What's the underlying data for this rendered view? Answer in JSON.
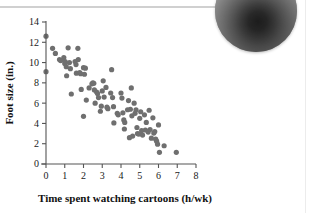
{
  "page": {
    "background_color": "#ffffff",
    "rule_color": "#d0d0d0"
  },
  "figure": {
    "photo": {
      "name": "swirl-photo",
      "shape": "circle",
      "description": "grayscale circular photo of a spiral/rope texture, cropped at page top-right"
    }
  },
  "chart_data": {
    "type": "scatter",
    "title": "",
    "xlabel": "Time spent watching cartoons (h/wk)",
    "ylabel": "Foot size (in.)",
    "xlim": [
      0,
      8
    ],
    "ylim": [
      0,
      14
    ],
    "xticks": [
      0,
      1,
      2,
      3,
      4,
      5,
      6,
      7,
      8
    ],
    "yticks": [
      0,
      2,
      4,
      6,
      8,
      10,
      12,
      14
    ],
    "xticklabels": [
      "0",
      "1",
      "2",
      "3",
      "4",
      "5",
      "6",
      "7",
      "8"
    ],
    "yticklabels": [
      "0",
      "2",
      "4",
      "6",
      "8",
      "10",
      "12",
      "14"
    ],
    "grid": false,
    "legend": null,
    "marker_color": "#6f6f6f",
    "marker_size": 2.6,
    "relationship": "negative linear association",
    "points": [
      [
        0.0,
        12.6
      ],
      [
        0.0,
        9.1
      ],
      [
        0.35,
        11.4
      ],
      [
        0.5,
        10.9
      ],
      [
        0.72,
        10.3
      ],
      [
        0.78,
        10.2
      ],
      [
        0.95,
        10.5
      ],
      [
        1.0,
        9.9
      ],
      [
        1.02,
        10.1
      ],
      [
        1.08,
        9.6
      ],
      [
        1.1,
        8.7
      ],
      [
        1.18,
        11.45
      ],
      [
        1.25,
        10.0
      ],
      [
        1.3,
        9.4
      ],
      [
        1.35,
        6.9
      ],
      [
        1.55,
        10.1
      ],
      [
        1.6,
        9.8
      ],
      [
        1.62,
        8.95
      ],
      [
        1.7,
        11.4
      ],
      [
        1.72,
        10.3
      ],
      [
        1.8,
        9.0
      ],
      [
        1.85,
        8.9
      ],
      [
        1.88,
        7.35
      ],
      [
        2.0,
        9.5
      ],
      [
        2.05,
        8.85
      ],
      [
        2.1,
        9.45
      ],
      [
        2.15,
        6.3
      ],
      [
        2.0,
        4.7
      ],
      [
        2.3,
        7.5
      ],
      [
        2.45,
        7.9
      ],
      [
        2.5,
        8.0
      ],
      [
        2.55,
        7.95
      ],
      [
        2.58,
        7.3
      ],
      [
        2.62,
        6.0
      ],
      [
        2.7,
        7.1
      ],
      [
        2.75,
        6.95
      ],
      [
        2.8,
        6.55
      ],
      [
        2.9,
        5.2
      ],
      [
        2.95,
        5.7
      ],
      [
        3.0,
        7.2
      ],
      [
        3.05,
        8.2
      ],
      [
        3.1,
        6.6
      ],
      [
        3.2,
        7.55
      ],
      [
        3.25,
        5.6
      ],
      [
        3.3,
        5.45
      ],
      [
        3.45,
        7.0
      ],
      [
        3.5,
        9.3
      ],
      [
        3.55,
        6.55
      ],
      [
        3.6,
        5.65
      ],
      [
        3.62,
        4.05
      ],
      [
        3.8,
        5.0
      ],
      [
        3.85,
        4.85
      ],
      [
        4.0,
        7.0
      ],
      [
        4.05,
        6.5
      ],
      [
        4.1,
        5.05
      ],
      [
        4.15,
        4.35
      ],
      [
        4.18,
        3.45
      ],
      [
        4.2,
        4.1
      ],
      [
        4.35,
        5.35
      ],
      [
        4.4,
        6.25
      ],
      [
        4.45,
        2.6
      ],
      [
        4.5,
        5.4
      ],
      [
        4.55,
        7.5
      ],
      [
        4.58,
        4.75
      ],
      [
        4.62,
        2.75
      ],
      [
        4.7,
        6.0
      ],
      [
        4.75,
        5.0
      ],
      [
        4.8,
        5.35
      ],
      [
        4.85,
        3.6
      ],
      [
        4.88,
        3.0
      ],
      [
        4.95,
        2.95
      ],
      [
        5.0,
        4.5
      ],
      [
        5.05,
        5.15
      ],
      [
        5.1,
        3.3
      ],
      [
        5.15,
        2.85
      ],
      [
        5.25,
        4.85
      ],
      [
        5.3,
        3.35
      ],
      [
        5.35,
        4.1
      ],
      [
        5.45,
        3.15
      ],
      [
        5.5,
        5.3
      ],
      [
        5.55,
        3.4
      ],
      [
        5.62,
        2.55
      ],
      [
        5.7,
        4.55
      ],
      [
        5.75,
        3.05
      ],
      [
        5.8,
        3.2
      ],
      [
        5.85,
        2.45
      ],
      [
        5.9,
        2.25
      ],
      [
        5.95,
        1.95
      ],
      [
        6.0,
        3.85
      ],
      [
        6.05,
        1.15
      ],
      [
        6.3,
        1.8
      ],
      [
        6.95,
        1.15
      ]
    ]
  }
}
